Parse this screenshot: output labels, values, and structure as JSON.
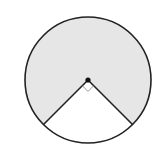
{
  "diagram": {
    "type": "circle-sector",
    "center": [
      88,
      80
    ],
    "radius": 63,
    "unshaded_angle_deg": 90,
    "shaded_angle_deg": 270,
    "colors": {
      "shaded": "#e6e6e6",
      "stroke": "#222222",
      "right_angle_marker": "#999999",
      "background": "#ffffff"
    }
  }
}
